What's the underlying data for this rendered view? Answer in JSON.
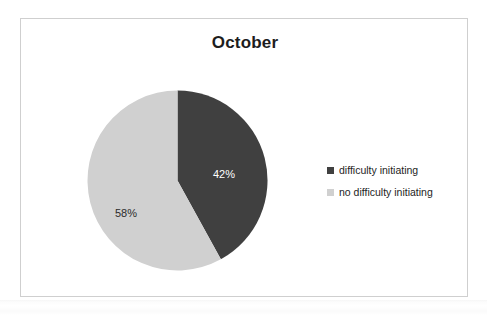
{
  "chart_data": {
    "type": "pie",
    "title": "October",
    "categories": [
      "difficulty initiating",
      "no difficulty initiating"
    ],
    "values": [
      42,
      58
    ],
    "value_unit": "%",
    "data_labels": [
      "42%",
      "58%"
    ],
    "colors": [
      "#404040",
      "#d0d0d0"
    ],
    "start_angle_deg": 0,
    "direction": "clockwise",
    "legend_position": "right",
    "grid": false,
    "xlabel": "",
    "ylabel": "",
    "slices": [
      {
        "label": "difficulty initiating",
        "value": 42,
        "display": "42%",
        "color": "#404040",
        "start_deg": 0,
        "end_deg": 151.2,
        "label_color": "#ffffff"
      },
      {
        "label": "no difficulty initiating",
        "value": 58,
        "display": "58%",
        "color": "#d0d0d0",
        "start_deg": 151.2,
        "end_deg": 360,
        "label_color": "#2b2b2b"
      }
    ]
  },
  "frame": {
    "border_color": "#cfcfcf",
    "background": "#ffffff"
  },
  "legend": {
    "entries": [
      {
        "marker": "legend-swatch-dark",
        "label": "difficulty initiating",
        "color": "#404040"
      },
      {
        "marker": "legend-swatch-light",
        "label": "no difficulty initiating",
        "color": "#d0d0d0"
      }
    ]
  }
}
